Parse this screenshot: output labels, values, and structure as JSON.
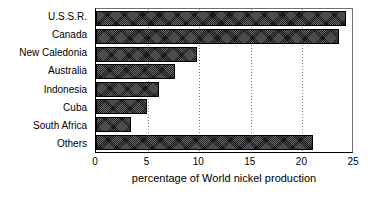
{
  "chart_data": {
    "type": "bar",
    "orientation": "horizontal",
    "title": "",
    "xlabel": "percentage of World nickel production",
    "ylabel": "",
    "categories": [
      "U.S.S.R.",
      "Canada",
      "New Caledonia",
      "Australia",
      "Indonesia",
      "Cuba",
      "South Africa",
      "Others"
    ],
    "values": [
      24.2,
      23.5,
      9.8,
      7.7,
      6.1,
      4.9,
      3.4,
      21.0
    ],
    "xlim": [
      0,
      25
    ],
    "xticks": [
      0,
      5,
      10,
      15,
      20,
      25
    ],
    "xtick_labels": [
      "0",
      "5",
      "10",
      "15",
      "20",
      "25"
    ],
    "gridlines": [
      5,
      10,
      15,
      20
    ],
    "grid": true,
    "grid_style": "dotted-vertical",
    "legend": null,
    "bar_color": "#1a1a1a",
    "bar_edge_color": "#000000",
    "background_color": "#ffffff",
    "text_color": "#000000"
  },
  "axis": {
    "x_title": "percentage of World nickel production"
  }
}
